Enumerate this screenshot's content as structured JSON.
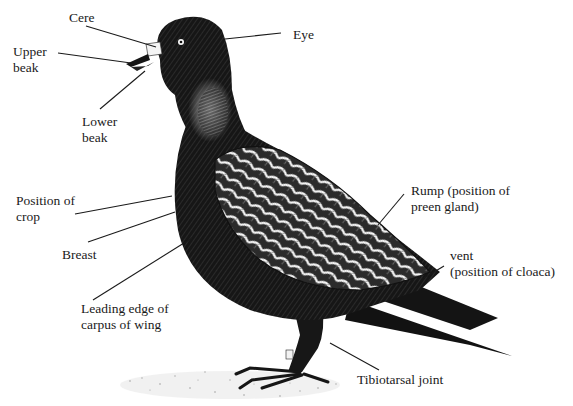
{
  "diagram": {
    "colors": {
      "ink": "#111111",
      "background": "#ffffff",
      "highlight": "#f2f2f2"
    },
    "labels": [
      {
        "id": "cere",
        "lines": [
          "Cere"
        ],
        "x": 69,
        "y": 10,
        "anchor": [
          160,
          46
        ]
      },
      {
        "id": "eye",
        "lines": [
          "Eye"
        ],
        "x": 293,
        "y": 27,
        "anchor": [
          225,
          39
        ]
      },
      {
        "id": "upper-beak",
        "lines": [
          "Upper",
          "beak"
        ],
        "x": 13,
        "y": 44,
        "anchor": [
          131,
          62
        ]
      },
      {
        "id": "lower-beak",
        "lines": [
          "Lower",
          "beak"
        ],
        "x": 82,
        "y": 114,
        "anchor": [
          146,
          72
        ]
      },
      {
        "id": "position-of-crop",
        "lines": [
          "Position of",
          "crop"
        ],
        "x": 16,
        "y": 193,
        "anchor": [
          172,
          197
        ]
      },
      {
        "id": "breast",
        "lines": [
          "Breast"
        ],
        "x": 62,
        "y": 247,
        "anchor": [
          176,
          212
        ]
      },
      {
        "id": "leading-edge-carpus",
        "lines": [
          "Leading edge of",
          "carpus of wing"
        ],
        "x": 81,
        "y": 301,
        "anchor": [
          192,
          238
        ]
      },
      {
        "id": "rump",
        "lines": [
          "Rump (position of",
          "preen gland)"
        ],
        "x": 411,
        "y": 183,
        "anchor": [
          378,
          224
        ]
      },
      {
        "id": "vent",
        "lines": [
          "vent",
          "(position of cloaca)"
        ],
        "x": 450,
        "y": 248,
        "anchor": [
          424,
          277
        ]
      },
      {
        "id": "tibiotarsal-joint",
        "lines": [
          "Tibiotarsal joint"
        ],
        "x": 357,
        "y": 372,
        "anchor": [
          330,
          343
        ]
      }
    ],
    "leaders": [
      {
        "id": "cere",
        "x1": 86,
        "y1": 26,
        "x2": 156,
        "y2": 47
      },
      {
        "id": "eye",
        "x1": 281,
        "y1": 33,
        "x2": 225,
        "y2": 39
      },
      {
        "id": "upper-beak",
        "x1": 58,
        "y1": 53,
        "x2": 131,
        "y2": 63
      },
      {
        "id": "lower-beak",
        "x1": 100,
        "y1": 109,
        "x2": 145,
        "y2": 71
      },
      {
        "id": "position-of-crop",
        "x1": 75,
        "y1": 214,
        "x2": 172,
        "y2": 196
      },
      {
        "id": "breast",
        "x1": 88,
        "y1": 242,
        "x2": 175,
        "y2": 212
      },
      {
        "id": "leading-edge-carpus",
        "x1": 93,
        "y1": 300,
        "x2": 192,
        "y2": 238
      },
      {
        "id": "rump",
        "x1": 378,
        "y1": 225,
        "x2": 404,
        "y2": 194
      },
      {
        "id": "vent",
        "x1": 424,
        "y1": 278,
        "x2": 444,
        "y2": 266
      },
      {
        "id": "tibiotarsal-joint",
        "x1": 330,
        "y1": 343,
        "x2": 379,
        "y2": 370
      }
    ]
  }
}
